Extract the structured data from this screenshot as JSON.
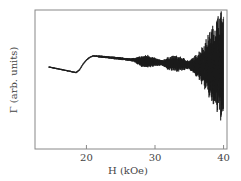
{
  "chart_data": {
    "type": "line",
    "title": "",
    "xlabel": "H (kOe)",
    "ylabel": "Γ (arb. units)",
    "xlim": [
      12.5,
      40.5
    ],
    "ylim": [
      0,
      1
    ],
    "xticks": [
      20,
      30,
      40
    ],
    "xtick_labels": [
      "20",
      "30",
      "40"
    ],
    "yticks": [],
    "grid": false,
    "legend": null,
    "series": [
      {
        "name": "Γ",
        "color": "#1a1a1a",
        "x": [
          14.5,
          15.5,
          16.5,
          17.5,
          18.5,
          19.0,
          19.5,
          20.0,
          20.5,
          21.0,
          22.0,
          23.0,
          24.0,
          25.0,
          26.0,
          27.0,
          28.0,
          29.0,
          30.0,
          31.0,
          32.0,
          33.0,
          34.0,
          35.0,
          36.0,
          37.0,
          38.0,
          39.0,
          39.5,
          40.0
        ],
        "values": [
          0.59,
          0.58,
          0.57,
          0.56,
          0.55,
          0.57,
          0.61,
          0.64,
          0.66,
          0.67,
          0.665,
          0.66,
          0.655,
          0.65,
          0.645,
          0.64,
          0.63,
          0.63,
          0.625,
          0.62,
          0.615,
          0.615,
          0.61,
          0.605,
          0.6,
          0.6,
          0.6,
          0.6,
          0.6,
          0.6
        ],
        "oscillation_amplitude": [
          0.005,
          0.005,
          0.005,
          0.005,
          0.005,
          0.005,
          0.005,
          0.005,
          0.005,
          0.005,
          0.008,
          0.008,
          0.01,
          0.01,
          0.01,
          0.015,
          0.04,
          0.05,
          0.03,
          0.02,
          0.05,
          0.06,
          0.05,
          0.03,
          0.08,
          0.15,
          0.25,
          0.35,
          0.4,
          0.4
        ]
      }
    ]
  }
}
